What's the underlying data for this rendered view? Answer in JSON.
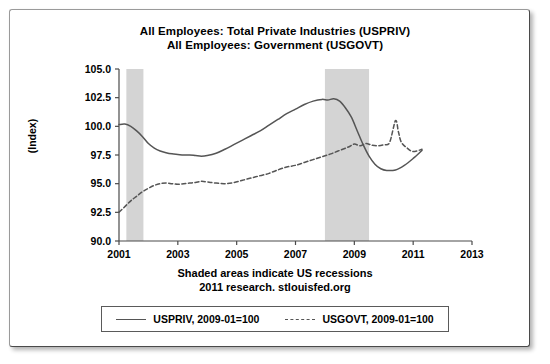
{
  "chart_data": {
    "type": "line",
    "title": "All Employees: Total Private Industries (USPRIV)\nAll Employees: Government (USGOVT)",
    "title_line1": "All Employees: Total Private Industries (USPRIV)",
    "title_line2": "All Employees: Government (USGOVT)",
    "caption_line1": "Shaded areas indicate US recessions",
    "caption_line2": "2011 research. stlouisfed.org",
    "xlabel": "",
    "ylabel": "(Index)",
    "xlim": [
      2001,
      2013
    ],
    "ylim": [
      90.0,
      105.0
    ],
    "grid": false,
    "legend_position": "bottom",
    "xticks": [
      2001,
      2003,
      2005,
      2007,
      2009,
      2011,
      2013
    ],
    "xtick_labels": [
      "2001",
      "2003",
      "2005",
      "2007",
      "2009",
      "2011",
      "2013"
    ],
    "yticks": [
      90.0,
      92.5,
      95.0,
      97.5,
      100.0,
      102.5,
      105.0
    ],
    "ytick_labels": [
      "90.0",
      "92.5",
      "95.0",
      "97.5",
      "100.0",
      "102.5",
      "105.0"
    ],
    "shaded_regions": [
      {
        "label": "US recession",
        "x0": 2001.25,
        "x1": 2001.83,
        "color": "#d4d4d4"
      },
      {
        "label": "US recession",
        "x0": 2008.0,
        "x1": 2009.5,
        "color": "#d4d4d4"
      }
    ],
    "series": [
      {
        "name": "USPRIV, 2009-01=100",
        "style": "solid",
        "color": "#555555",
        "x": [
          2001.0,
          2001.2,
          2001.4,
          2001.6,
          2001.8,
          2002.0,
          2002.2,
          2002.4,
          2002.6,
          2002.8,
          2003.0,
          2003.2,
          2003.4,
          2003.6,
          2003.8,
          2004.0,
          2004.3,
          2004.6,
          2004.9,
          2005.2,
          2005.5,
          2005.8,
          2006.1,
          2006.4,
          2006.7,
          2007.0,
          2007.3,
          2007.6,
          2007.9,
          2008.1,
          2008.3,
          2008.5,
          2008.7,
          2008.9,
          2009.1,
          2009.3,
          2009.5,
          2009.7,
          2009.9,
          2010.1,
          2010.4,
          2010.7,
          2011.0,
          2011.3
        ],
        "values": [
          100.15,
          100.2,
          100.0,
          99.6,
          99.1,
          98.5,
          98.1,
          97.85,
          97.7,
          97.6,
          97.55,
          97.5,
          97.5,
          97.45,
          97.4,
          97.45,
          97.65,
          98.0,
          98.4,
          98.8,
          99.2,
          99.6,
          100.1,
          100.6,
          101.1,
          101.5,
          101.9,
          102.2,
          102.35,
          102.3,
          102.4,
          102.2,
          101.6,
          100.8,
          99.6,
          98.4,
          97.4,
          96.7,
          96.3,
          96.15,
          96.2,
          96.6,
          97.2,
          97.9
        ]
      },
      {
        "name": "USGOVT, 2009-01=100",
        "style": "dashed",
        "color": "#555555",
        "x": [
          2001.0,
          2001.2,
          2001.4,
          2001.6,
          2001.8,
          2002.0,
          2002.2,
          2002.4,
          2002.6,
          2002.8,
          2003.0,
          2003.2,
          2003.4,
          2003.6,
          2003.8,
          2004.0,
          2004.3,
          2004.6,
          2004.9,
          2005.2,
          2005.5,
          2005.8,
          2006.1,
          2006.4,
          2006.7,
          2007.0,
          2007.3,
          2007.6,
          2007.9,
          2008.2,
          2008.5,
          2008.8,
          2009.0,
          2009.2,
          2009.4,
          2009.6,
          2009.8,
          2010.0,
          2010.2,
          2010.4,
          2010.5,
          2010.6,
          2010.8,
          2011.0,
          2011.3
        ],
        "values": [
          92.5,
          93.0,
          93.5,
          93.9,
          94.3,
          94.6,
          94.85,
          95.0,
          95.05,
          95.0,
          94.95,
          95.0,
          95.05,
          95.1,
          95.2,
          95.15,
          95.05,
          95.0,
          95.1,
          95.3,
          95.5,
          95.7,
          95.9,
          96.2,
          96.45,
          96.6,
          96.85,
          97.1,
          97.35,
          97.6,
          97.9,
          98.2,
          98.45,
          98.3,
          98.5,
          98.35,
          98.3,
          98.4,
          98.6,
          100.5,
          99.5,
          98.6,
          98.1,
          97.8,
          98.0
        ]
      }
    ]
  },
  "legend": {
    "entries": [
      {
        "label": "USPRIV, 2009-01=100",
        "style": "solid"
      },
      {
        "label": "USGOVT, 2009-01=100",
        "style": "dashed"
      }
    ]
  }
}
